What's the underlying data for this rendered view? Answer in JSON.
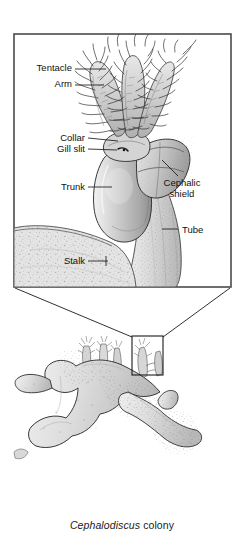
{
  "figure": {
    "title_caption": {
      "genus": "Cephalodiscus",
      "rest": " colony"
    },
    "inset": {
      "name": "magnified-zooid-inset",
      "border_color": "#4a4a4a",
      "labels": [
        {
          "id": "tentacle",
          "text": "Tentacle",
          "x": 72,
          "y": 66,
          "align": "right"
        },
        {
          "id": "arm",
          "text": "Arm",
          "x": 72,
          "y": 82,
          "align": "right"
        },
        {
          "id": "collar",
          "text": "Collar",
          "x": 85,
          "y": 135,
          "align": "right"
        },
        {
          "id": "gill-slit",
          "text": "Gill slit",
          "x": 85,
          "y": 146,
          "align": "right"
        },
        {
          "id": "trunk",
          "text": "Trunk",
          "x": 85,
          "y": 184,
          "align": "right"
        },
        {
          "id": "cephalic-shield",
          "text": "Cephalic",
          "x": 182,
          "y": 182,
          "align": "center"
        },
        {
          "id": "cephalic-shield2",
          "text": "shield",
          "x": 182,
          "y": 193,
          "align": "center"
        },
        {
          "id": "tube",
          "text": "Tube",
          "x": 182,
          "y": 232,
          "align": "left"
        },
        {
          "id": "stalk",
          "text": "Stalk",
          "x": 85,
          "y": 258,
          "align": "right"
        }
      ]
    },
    "colony": {
      "name": "cephalodiscus-colony-illustration",
      "callout_box": {
        "x": 132,
        "y": 336,
        "w": 31,
        "h": 39
      }
    },
    "colors": {
      "line": "#1a1a1a",
      "body_fill": "#c9c9c9",
      "tube_fill": "#dcdcdc",
      "background": "#ffffff"
    }
  }
}
